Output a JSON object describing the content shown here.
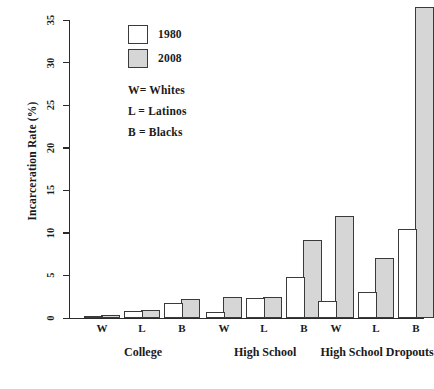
{
  "chart_data": {
    "type": "bar",
    "title": "",
    "xlabel": "",
    "ylabel": "Incarceration Rate (%)",
    "ylim": [
      0,
      35
    ],
    "yticks": [
      0,
      5,
      10,
      15,
      20,
      25,
      30,
      35
    ],
    "grid": false,
    "legend_position": "top-center-left",
    "groups": [
      {
        "name": "College",
        "categories": [
          {
            "code": "W",
            "meaning": "Whites"
          },
          {
            "code": "L",
            "meaning": "Latinos"
          },
          {
            "code": "B",
            "meaning": "Blacks"
          }
        ]
      },
      {
        "name": "High School",
        "categories": [
          {
            "code": "W",
            "meaning": "Whites"
          },
          {
            "code": "L",
            "meaning": "Latinos"
          },
          {
            "code": "B",
            "meaning": "Blacks"
          }
        ]
      },
      {
        "name": "High School Dropouts",
        "categories": [
          {
            "code": "W",
            "meaning": "Whites"
          },
          {
            "code": "L",
            "meaning": "Latinos"
          },
          {
            "code": "B",
            "meaning": "Blacks"
          }
        ]
      }
    ],
    "categories": [
      "College W",
      "College L",
      "College B",
      "High School W",
      "High School L",
      "High School B",
      "High School Dropouts W",
      "High School Dropouts L",
      "High School Dropouts B"
    ],
    "series": [
      {
        "name": "1980",
        "color": "#ffffff",
        "values": [
          0.2,
          0.8,
          1.8,
          0.7,
          2.3,
          4.8,
          2.0,
          3.0,
          10.5
        ]
      },
      {
        "name": "2008",
        "color": "#d6d6d6",
        "values": [
          0.3,
          1.0,
          2.2,
          2.5,
          2.5,
          9.2,
          12.0,
          7.0,
          36.5
        ]
      }
    ]
  },
  "legend": {
    "entries": [
      {
        "label": "1980",
        "swatch": "white-square"
      },
      {
        "label": "2008",
        "swatch": "gray-square"
      }
    ],
    "notes": [
      "W= Whites",
      "L = Latinos",
      "B = Blacks"
    ]
  },
  "axis": {
    "y_title": "Incarceration Rate (%)",
    "y_ticks": [
      "0",
      "5",
      "10",
      "15",
      "20",
      "25",
      "30",
      "35"
    ]
  },
  "x_labels": {
    "codes": [
      "W",
      "L",
      "B",
      "W",
      "L",
      "B",
      "W",
      "L",
      "B"
    ],
    "groups": [
      "College",
      "High School",
      "High School Dropouts"
    ]
  },
  "colors": {
    "bar_1980": "#ffffff",
    "bar_2008": "#d6d6d6",
    "outline": "#3a3a3a",
    "axis": "#2b2b2b",
    "text": "#1a1a1a",
    "background": "#ffffff"
  }
}
